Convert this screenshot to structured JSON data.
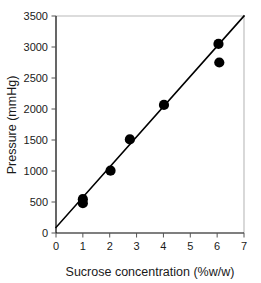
{
  "chart_data": {
    "type": "scatter",
    "title": "",
    "xlabel": "Sucrose concentration (%w/w)",
    "ylabel": "Pressure (mmHg)",
    "xlim": [
      0,
      7
    ],
    "ylim": [
      0,
      3500
    ],
    "grid": false,
    "legend": "none",
    "xticks": [
      "0",
      "1",
      "2",
      "3",
      "4",
      "5",
      "6",
      "7"
    ],
    "xtick_values": [
      0,
      1,
      2,
      3,
      4,
      5,
      6,
      7
    ],
    "yticks": [
      "0",
      "500",
      "1000",
      "1500",
      "2000",
      "2500",
      "3000",
      "3500"
    ],
    "ytick_values": [
      0,
      500,
      1000,
      1500,
      2000,
      2500,
      3000,
      3500
    ],
    "series": [
      {
        "name": "Measured pressure",
        "marker": "filled-circle",
        "color": "#000000",
        "points": [
          {
            "x": 1.0,
            "y": 480
          },
          {
            "x": 1.0,
            "y": 545
          },
          {
            "x": 2.03,
            "y": 1005
          },
          {
            "x": 2.75,
            "y": 1510
          },
          {
            "x": 4.02,
            "y": 2065
          },
          {
            "x": 6.05,
            "y": 3050
          },
          {
            "x": 6.08,
            "y": 2750
          }
        ]
      }
    ],
    "fit_line": {
      "name": "Linear fit",
      "color": "#000000",
      "x_start": 0,
      "y_start": 90,
      "x_end": 7,
      "y_end": 3500
    }
  }
}
